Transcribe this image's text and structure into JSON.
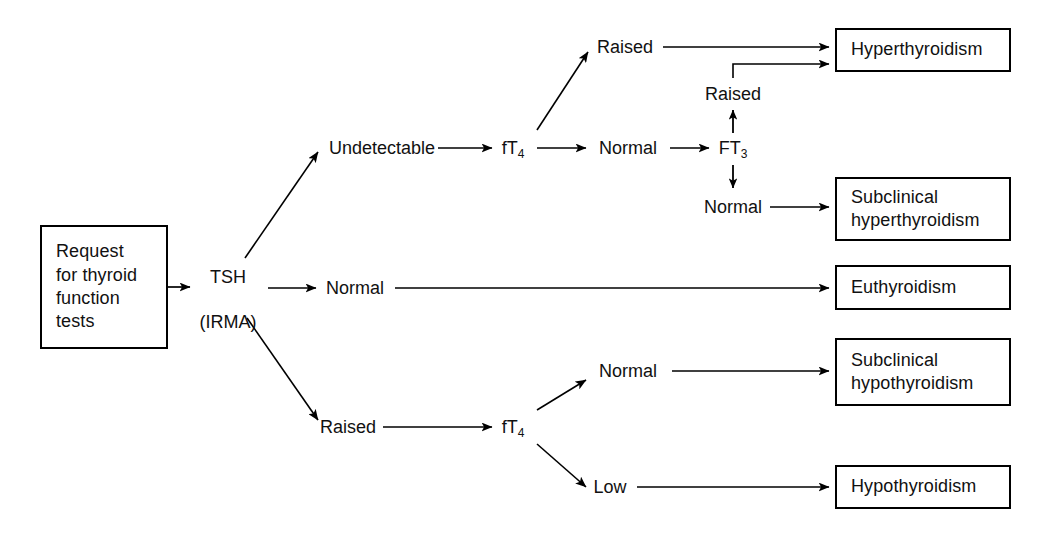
{
  "diagram": {
    "stroke_color": "#000000",
    "background_color": "#ffffff",
    "start": {
      "label": "Request\nfor thyroid\nfunction\ntests"
    },
    "tsh_node": {
      "line1": "TSH",
      "line2": "(IRMA)",
      "label": "TSH\n(IRMA)"
    },
    "tsh_branches": {
      "undetectable": "Undetectable",
      "normal": "Normal",
      "raised": "Raised"
    },
    "upper": {
      "ft4": "fT",
      "ft4_sub": "4",
      "raised": "Raised",
      "normal": "Normal",
      "ft3": "FT",
      "ft3_sub": "3",
      "ft3_raised": "Raised",
      "ft3_normal": "Normal"
    },
    "lower": {
      "ft4": "fT",
      "ft4_sub": "4",
      "normal": "Normal",
      "low": "Low"
    },
    "outcomes": {
      "hyperthyroidism": "Hyperthyroidism",
      "subclinical_hyperthyroidism": "Subclinical\nhyperthyroidism",
      "euthyroidism": "Euthyroidism",
      "subclinical_hypothyroidism": "Subclinical\nhypothyroidism",
      "hypothyroidism": "Hypothyroidism"
    }
  }
}
